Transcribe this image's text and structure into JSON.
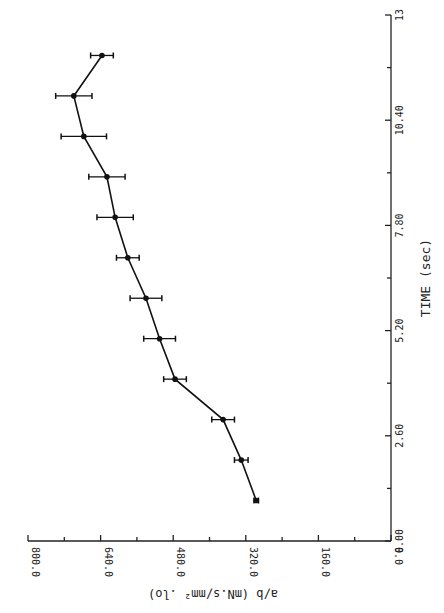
{
  "chart_data": {
    "type": "line",
    "orientation": "rotated 90deg (time axis vertical on right, value axis horizontal at bottom)",
    "title": "",
    "xlabel": "TIME (sec)",
    "ylabel": "a/b (mN.s/mm² .lo)",
    "xlim": [
      0,
      13
    ],
    "ylim": [
      0,
      800
    ],
    "x_ticks": [
      "0.00",
      "2.60",
      "5.20",
      "7.80",
      "10.40",
      "13"
    ],
    "y_ticks": [
      "0.0",
      "160.0",
      "320.0",
      "480.0",
      "640.0",
      "800.0"
    ],
    "grid": false,
    "error_bars": true,
    "series": [
      {
        "name": "a/b",
        "x": [
          1,
          2,
          3,
          4,
          5,
          6,
          7,
          8,
          9,
          10,
          11,
          12
        ],
        "values": [
          297,
          330,
          370,
          476,
          510,
          540,
          580,
          608,
          626,
          677,
          699,
          637
        ],
        "errors": [
          5,
          15,
          25,
          25,
          35,
          35,
          25,
          40,
          40,
          50,
          40,
          25
        ]
      }
    ]
  }
}
